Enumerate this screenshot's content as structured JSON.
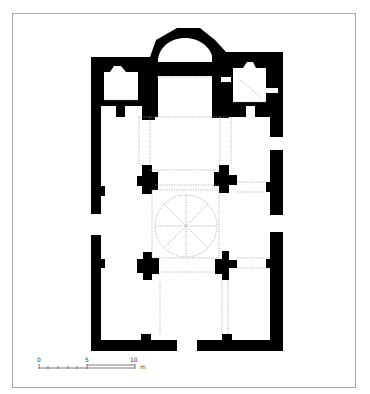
{
  "figure": {
    "type": "architectural floor plan",
    "colors": {
      "wall": "#000000",
      "background": "#ffffff",
      "frame": "#a9a9a9",
      "hidden_lines": "#9a9a9a"
    }
  },
  "scale_bar": {
    "ticks": [
      "0",
      "5",
      "10"
    ],
    "unit": "m"
  }
}
